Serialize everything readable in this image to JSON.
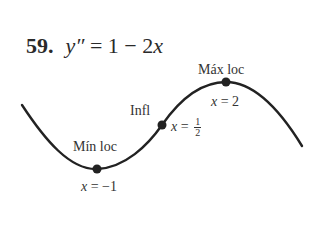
{
  "problem": {
    "number": "59.",
    "equation_lhs": "y″",
    "equation_eq": " = 1 − 2",
    "equation_var": "x"
  },
  "points": {
    "max": {
      "label": "Máx loc",
      "x_var": "x",
      "x_eq": " = 2"
    },
    "inflection": {
      "label": "Infl",
      "x_var": "x",
      "x_eq": " = ",
      "frac_num": "1",
      "frac_den": "2"
    },
    "min": {
      "label": "Mín loc",
      "x_var": "x",
      "x_eq": " = −1"
    }
  },
  "colors": {
    "curve": "#222222",
    "point": "#222222",
    "text": "#333333"
  }
}
